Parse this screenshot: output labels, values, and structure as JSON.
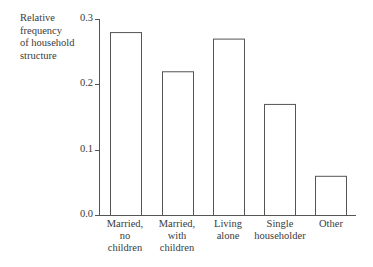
{
  "chart_data": {
    "type": "bar",
    "title": "",
    "xlabel": "",
    "ylabel": "Relative frequency of household structure",
    "ylim": [
      0.0,
      0.3
    ],
    "yticks": [
      "0.0",
      "0.1",
      "0.2",
      "0.3"
    ],
    "categories": [
      "Married, no children",
      "Married, with children",
      "Living alone",
      "Single householder",
      "Other"
    ],
    "values": [
      0.28,
      0.22,
      0.27,
      0.17,
      0.06
    ],
    "grid": false,
    "legend": null
  },
  "labels": {
    "ylabel": "Relative\nfrequency\nof household\nstructure",
    "ticks": [
      "0.0",
      "0.1",
      "0.2",
      "0.3"
    ],
    "categories": [
      "Married,\nno\nchildren",
      "Married,\nwith\nchildren",
      "Living\nalone",
      "Single\nhouseholder",
      "Other"
    ]
  },
  "colors": {
    "bar_stroke": "#555555",
    "bar_fill": "#ffffff",
    "axis": "#555555"
  }
}
